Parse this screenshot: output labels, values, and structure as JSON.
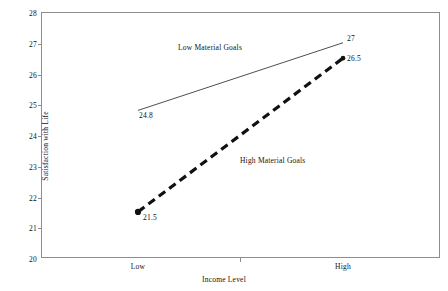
{
  "chart_data": {
    "type": "line",
    "title": "",
    "xlabel": "Income Level",
    "ylabel": "Satisfaction with Life",
    "categories": [
      "Low",
      "High"
    ],
    "ylim": [
      20,
      28
    ],
    "yticks": [
      "20",
      "21",
      "22",
      "23",
      "24",
      "25",
      "26",
      "27",
      "28"
    ],
    "grid": false,
    "legend_position": "inline-annotations",
    "series": [
      {
        "name": "Low Material Goals",
        "values": [
          24.8,
          27
        ],
        "point_labels": [
          "24.8",
          "27"
        ],
        "style": "solid-thin",
        "color": "#3a3a3a"
      },
      {
        "name": "High Material Goals",
        "values": [
          21.5,
          26.5
        ],
        "point_labels": [
          "21.5",
          "26.5"
        ],
        "style": "dashed-thick",
        "color": "#111111"
      }
    ]
  },
  "axes": {
    "y_ticks": [
      {
        "label": "28",
        "value": 28
      },
      {
        "label": "27",
        "value": 27
      },
      {
        "label": "26",
        "value": 26
      },
      {
        "label": "25",
        "value": 25
      },
      {
        "label": "24",
        "value": 24
      },
      {
        "label": "23",
        "value": 23
      },
      {
        "label": "22",
        "value": 22
      },
      {
        "label": "21",
        "value": 21
      },
      {
        "label": "20",
        "value": 20
      }
    ],
    "y_title": "Satisfaction with Life",
    "x_categories": [
      {
        "label": "Low"
      },
      {
        "label": "High"
      }
    ],
    "x_title": "Income Level"
  },
  "annotations": {
    "low_goals_series_label": "Low Material Goals",
    "high_goals_series_label": "High Material Goals",
    "low_goals_left_value": "24.8",
    "low_goals_right_value": "27",
    "high_goals_left_value": "21.5",
    "high_goals_right_value": "26.5"
  },
  "colors": {
    "frame": "#8d8d8d",
    "text": "#111111",
    "solid_series": "#3a3a3a",
    "dashed_series": "#111111",
    "background": "#ffffff"
  }
}
